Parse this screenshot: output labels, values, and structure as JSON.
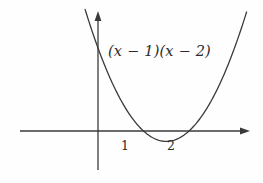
{
  "figure": {
    "background_color": "#fefefe",
    "stroke_color": "#3a3a3a",
    "text_color": "#2b2b2b",
    "curve_label": "(x − 1)(x − 2)",
    "x_tick_labels": [
      "1",
      "2"
    ],
    "y_tick_labels": []
  },
  "chart_data": {
    "type": "line",
    "title": "",
    "subtitle": "",
    "xlabel": "",
    "ylabel": "",
    "grid": false,
    "legend_position": "none",
    "annotations": [
      {
        "text": "(x − 1)(x − 2)",
        "x": 1.0,
        "y": 4.6,
        "role": "curve-equation-label"
      }
    ],
    "axes": {
      "x_axis": {
        "visible": true,
        "arrow": "right",
        "pixel_y": 131,
        "pixel_x_start": 20,
        "pixel_x_end": 250,
        "data_origin_pixel_x": 98,
        "pixels_per_unit": 45.5,
        "ticks": [
          {
            "label": "1",
            "value": 1,
            "pixel_x": 125
          },
          {
            "label": "2",
            "value": 2,
            "pixel_x": 170
          }
        ],
        "range": [
          -1.72,
          3.35
        ]
      },
      "y_axis": {
        "visible": true,
        "arrow": "up",
        "pixel_x": 98,
        "pixel_y_top": 12,
        "pixel_y_bottom": 170,
        "data_origin_pixel_y": 131,
        "pixels_per_unit": 41.5,
        "ticks": [],
        "range": [
          -0.94,
          2.87
        ]
      }
    },
    "series": [
      {
        "name": "(x - 1)(x - 2)",
        "expression": "(x-1)*(x-2)",
        "roots": [
          1,
          2
        ],
        "vertex": {
          "x": 1.5,
          "y": -0.25
        },
        "y_intercept": 2,
        "color": "#3a3a3a",
        "x": [
          -0.55,
          -0.4,
          -0.25,
          -0.1,
          0.0,
          0.15,
          0.3,
          0.45,
          0.6,
          0.75,
          0.9,
          1.0,
          1.1,
          1.25,
          1.4,
          1.5,
          1.6,
          1.75,
          1.9,
          2.0,
          2.1,
          2.25,
          2.4,
          2.55,
          2.7,
          2.85,
          2.95
        ],
        "y": [
          3.95,
          3.36,
          2.81,
          2.31,
          2.0,
          1.57,
          1.19,
          0.85,
          0.56,
          0.31,
          0.11,
          0.0,
          -0.09,
          -0.19,
          -0.24,
          -0.25,
          -0.24,
          -0.19,
          -0.09,
          0.0,
          0.11,
          0.31,
          0.56,
          0.85,
          1.19,
          1.57,
          1.85
        ]
      }
    ]
  }
}
